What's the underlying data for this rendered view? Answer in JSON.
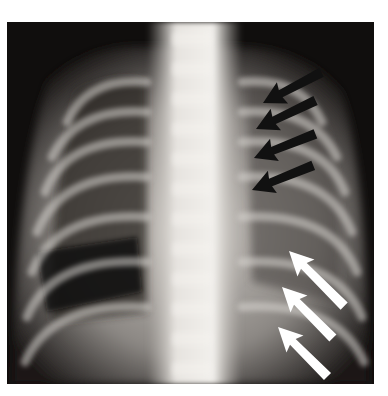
{
  "image": {
    "subject": "frontal chest radiograph (infant)",
    "alt": "Chest X-ray with four black arrows pointing to the left upper/mid hemithorax and three white arrows pointing to the left lower hemithorax",
    "colors": {
      "background": "#ffffff",
      "film_dark": "#0e0c0b",
      "bone_light": "#e8e6e2",
      "black_arrow": "#111111",
      "white_arrow": "#ffffff"
    }
  },
  "annotations": {
    "black_arrows": [
      {
        "tail": [
          322,
          72
        ],
        "tip": [
          263,
          103
        ]
      },
      {
        "tail": [
          316,
          100
        ],
        "tip": [
          256,
          129
        ]
      },
      {
        "tail": [
          316,
          132
        ],
        "tip": [
          254,
          158
        ]
      },
      {
        "tail": [
          314,
          165
        ],
        "tip": [
          252,
          190
        ]
      }
    ],
    "white_arrows": [
      {
        "tail": [
          344,
          306
        ],
        "tip": [
          289,
          251
        ]
      },
      {
        "tail": [
          333,
          340
        ],
        "tip": [
          282,
          287
        ]
      },
      {
        "tail": [
          330,
          375
        ],
        "tip": [
          278,
          327
        ]
      }
    ]
  }
}
